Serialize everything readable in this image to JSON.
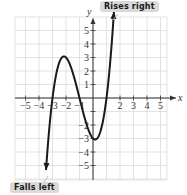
{
  "chart_data": {
    "type": "line",
    "title": "",
    "function": "f(x) = x^3 + 3x^2 - x - 3",
    "xlabel": "x",
    "ylabel": "y",
    "xlim": [
      -6,
      6
    ],
    "ylim": [
      -6,
      6
    ],
    "grid": true,
    "x_ticks": [
      -5,
      -4,
      -3,
      -2,
      -1,
      1,
      2,
      3,
      4,
      5
    ],
    "x_tick_labels": [
      "−5",
      "−4",
      "−3",
      "−2",
      "−1",
      "",
      "2",
      "3",
      "4",
      "5"
    ],
    "y_ticks": [
      -5,
      -4,
      -3,
      -2,
      -1,
      1,
      2,
      3,
      4,
      5
    ],
    "y_tick_labels": [
      "−5",
      "−4",
      "−3",
      "−2",
      "",
      "1",
      "2",
      "3",
      "4",
      "5"
    ],
    "key_points": {
      "x_intercepts": [
        -3,
        -1,
        1
      ],
      "y_intercept": -3,
      "local_max": [
        -2,
        3
      ],
      "local_min": [
        0,
        -3
      ]
    },
    "series": [
      {
        "name": "f(x)",
        "x": [
          -3.5,
          -3,
          -2.5,
          -2,
          -1.5,
          -1,
          -0.5,
          0,
          0.5,
          1,
          1.5
        ],
        "y": [
          -5.63,
          0,
          2.63,
          3,
          1.88,
          0,
          -1.88,
          -3,
          -2.63,
          0,
          5.63
        ]
      }
    ],
    "annotations": [
      {
        "text": "Rises right",
        "points_to": [
          1.5,
          5.6
        ]
      },
      {
        "text": "Falls left",
        "points_to": [
          -3.5,
          -5.6
        ]
      }
    ]
  },
  "labels": {
    "rises_right": "Rises right",
    "falls_left": "Falls left",
    "x_axis": "x",
    "y_axis": "y"
  },
  "colors": {
    "curve": "#1a1a1a",
    "grid": "#dcdcdc",
    "axis": "#333333",
    "callout_bg": "#d9d9d9"
  }
}
